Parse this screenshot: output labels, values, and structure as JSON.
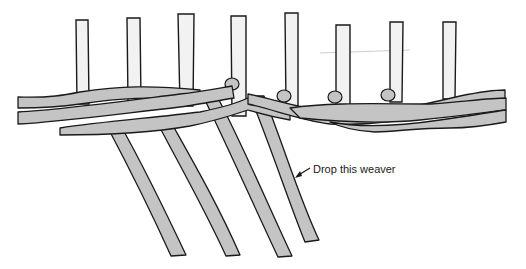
{
  "diagram": {
    "annotation": {
      "text": "Drop this weaver"
    },
    "colors": {
      "weaver_fill": "#c4c4c4",
      "stake_fill": "#f2f2f2",
      "outline": "#1a1a1a",
      "background": "#ffffff"
    },
    "stake_count": 8,
    "dropped_weaver_count": 4
  }
}
